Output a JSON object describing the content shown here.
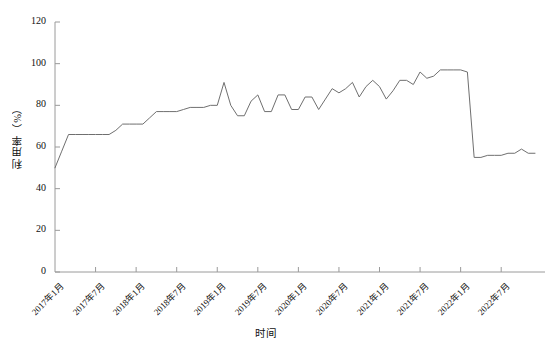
{
  "chart_data": {
    "type": "line",
    "title": "",
    "xlabel": "时间",
    "ylabel": "利用率（%）",
    "ylim": [
      0,
      120
    ],
    "yticks": [
      0,
      20,
      40,
      60,
      80,
      100,
      120
    ],
    "ytick_labels": [
      "0",
      "20",
      "40",
      "60",
      "80",
      "100",
      "120"
    ],
    "grid": false,
    "legend": "none",
    "line_color": "#6f6f6f",
    "axis_color": "#9a9a9a",
    "x_start": "2017年1月",
    "x_end": "2022年12月",
    "xtick_labels": [
      "2017年1月",
      "2017年7月",
      "2018年1月",
      "2018年7月",
      "2019年1月",
      "2019年7月",
      "2020年1月",
      "2020年7月",
      "2021年1月",
      "2021年7月",
      "2022年1月",
      "2022年7月"
    ],
    "xtick_indices": [
      0,
      6,
      12,
      18,
      24,
      30,
      36,
      42,
      48,
      54,
      60,
      66
    ],
    "x": [
      "2017年1月",
      "2017年2月",
      "2017年3月",
      "2017年4月",
      "2017年5月",
      "2017年6月",
      "2017年7月",
      "2017年8月",
      "2017年9月",
      "2017年10月",
      "2017年11月",
      "2017年12月",
      "2018年1月",
      "2018年2月",
      "2018年3月",
      "2018年4月",
      "2018年5月",
      "2018年6月",
      "2018年7月",
      "2018年8月",
      "2018年9月",
      "2018年10月",
      "2018年11月",
      "2018年12月",
      "2019年1月",
      "2019年2月",
      "2019年3月",
      "2019年4月",
      "2019年5月",
      "2019年6月",
      "2019年7月",
      "2019年8月",
      "2019年9月",
      "2019年10月",
      "2019年11月",
      "2019年12月",
      "2020年1月",
      "2020年2月",
      "2020年3月",
      "2020年4月",
      "2020年5月",
      "2020年6月",
      "2020年7月",
      "2020年8月",
      "2020年9月",
      "2020年10月",
      "2020年11月",
      "2020年12月",
      "2021年1月",
      "2021年2月",
      "2021年3月",
      "2021年4月",
      "2021年5月",
      "2021年6月",
      "2021年7月",
      "2021年8月",
      "2021年9月",
      "2021年10月",
      "2021年11月",
      "2021年12月",
      "2022年1月",
      "2022年2月",
      "2022年3月",
      "2022年4月",
      "2022年5月",
      "2022年6月",
      "2022年7月",
      "2022年8月",
      "2022年9月",
      "2022年10月",
      "2022年11月",
      "2022年12月"
    ],
    "values": [
      50,
      58,
      66,
      66,
      66,
      66,
      66,
      66,
      66,
      68,
      71,
      71,
      71,
      71,
      74,
      77,
      77,
      77,
      77,
      78,
      79,
      79,
      79,
      80,
      80,
      91,
      80,
      75,
      75,
      82,
      85,
      77,
      77,
      85,
      85,
      78,
      78,
      84,
      84,
      78,
      83,
      88,
      86,
      88,
      91,
      84,
      89,
      92,
      89,
      83,
      87,
      92,
      92,
      90,
      96,
      93,
      94,
      97,
      97,
      97,
      97,
      96,
      55,
      55,
      56,
      56,
      56,
      57,
      57,
      59,
      57,
      57
    ]
  },
  "axes": {
    "plot_left_px": 55,
    "plot_right_px": 535,
    "plot_top_px": 22,
    "plot_bottom_px": 272
  }
}
